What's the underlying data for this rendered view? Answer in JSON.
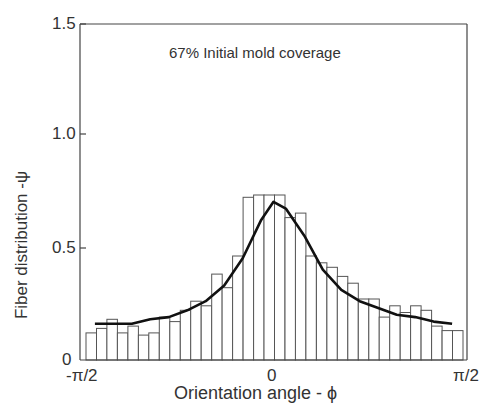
{
  "chart_data": {
    "type": "bar",
    "title": "",
    "annotation": "67% Initial mold coverage",
    "xlabel": "Orientation angle - ϕ",
    "ylabel": "Fiber distribution -ψ",
    "xlim": [
      -1.5708,
      1.5708
    ],
    "ylim": [
      0,
      1.5
    ],
    "x_ticks": [
      "-π/2",
      "0",
      "π/2"
    ],
    "y_ticks": [
      "0",
      "0.5",
      "1.0",
      "1.5"
    ],
    "grid": false,
    "legend": null,
    "series": [
      {
        "name": "Histogram",
        "type": "bar",
        "values": [
          0.12,
          0.14,
          0.18,
          0.12,
          0.15,
          0.11,
          0.12,
          0.19,
          0.17,
          0.22,
          0.26,
          0.24,
          0.38,
          0.32,
          0.46,
          0.72,
          0.73,
          0.73,
          0.73,
          0.63,
          0.65,
          0.46,
          0.43,
          0.41,
          0.37,
          0.34,
          0.27,
          0.27,
          0.19,
          0.24,
          0.21,
          0.24,
          0.22,
          0.15,
          0.13,
          0.13
        ]
      },
      {
        "name": "Fitted distribution",
        "type": "line",
        "x": [
          -1.45,
          -1.3,
          -1.15,
          -1.0,
          -0.85,
          -0.7,
          -0.55,
          -0.4,
          -0.25,
          -0.1,
          0.0,
          0.1,
          0.25,
          0.4,
          0.55,
          0.7,
          0.85,
          1.0,
          1.15,
          1.3,
          1.45
        ],
        "values": [
          0.16,
          0.16,
          0.16,
          0.18,
          0.19,
          0.22,
          0.26,
          0.33,
          0.45,
          0.62,
          0.7,
          0.67,
          0.55,
          0.4,
          0.31,
          0.26,
          0.23,
          0.2,
          0.19,
          0.17,
          0.16
        ]
      }
    ]
  }
}
